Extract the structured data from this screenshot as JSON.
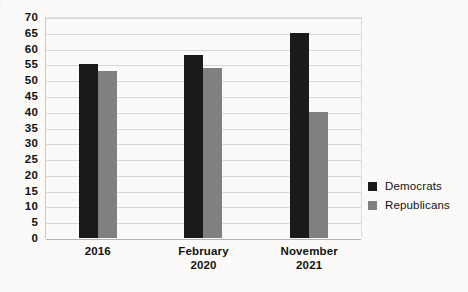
{
  "chart_data": {
    "type": "bar",
    "title": "",
    "xlabel": "",
    "ylabel": "",
    "ylim": [
      0,
      70
    ],
    "ytick_step": 5,
    "yticks": [
      70,
      65,
      60,
      55,
      50,
      45,
      40,
      35,
      30,
      25,
      20,
      15,
      10,
      5,
      0
    ],
    "grid": true,
    "legend_position": "right",
    "categories": [
      "2016",
      "February 2020",
      "November 2021"
    ],
    "category_lines": [
      [
        "2016"
      ],
      [
        "February",
        "2020"
      ],
      [
        "November",
        "2021"
      ]
    ],
    "series": [
      {
        "name": "Democrats",
        "color": "#1a1a1a",
        "values": [
          55,
          58,
          65
        ]
      },
      {
        "name": "Republicans",
        "color": "#808080",
        "values": [
          53,
          54,
          40
        ]
      }
    ]
  },
  "legend": {
    "items": [
      {
        "label": "Democrats",
        "swatch": "dem"
      },
      {
        "label": "Republicans",
        "swatch": "rep"
      }
    ]
  },
  "colors": {
    "democrat": "#1a1a1a",
    "republican": "#808080",
    "grid": "#d8d8d8",
    "axis": "#b4b4b4",
    "text": "#121212",
    "background": "#fbfaf8"
  }
}
